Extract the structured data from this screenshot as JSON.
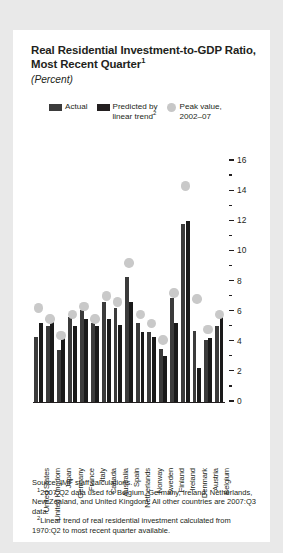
{
  "card": {
    "title_line1": "Real Residential Investment-to-GDP Ratio,",
    "title_line2": "Most Recent Quarter",
    "title_footnote_marker": "1",
    "subtitle": "(Percent)"
  },
  "legend": {
    "items": [
      {
        "label": "Actual",
        "marker": "square",
        "color": "#3b3b3b"
      },
      {
        "label": "Predicted by\nlinear trend",
        "footnote_marker": "2",
        "marker": "square",
        "color": "#231f20"
      },
      {
        "label": "Peak value,\n2002–07",
        "marker": "circle",
        "color": "#c7c7c7"
      }
    ]
  },
  "footnotes": {
    "source": "Source: IMF staff calculations.",
    "note1_marker": "1",
    "note1": "2007:Q2 data used for Belgium, Germany, Ireland, Netherlands, New Zealand, and United Kingdom. All other countries are 2007:Q3 data.",
    "note2_marker": "2",
    "note2": "Linear trend of real residential investment calculated from 1970:Q2 to most recent quarter available."
  },
  "chart_data": {
    "type": "bar",
    "title": "Real Residential Investment-to-GDP Ratio, Most Recent Quarter",
    "subtitle": "(Percent)",
    "xlabel": "",
    "ylabel": "Percent",
    "ylim": [
      0,
      16
    ],
    "ytick_major": [
      0,
      2,
      4,
      6,
      8,
      10,
      12,
      14,
      16
    ],
    "ytick_minor": [
      1,
      3,
      5,
      7,
      9,
      11,
      13,
      15
    ],
    "grid": false,
    "legend_position": "top",
    "categories": [
      "United States",
      "United Kingdom",
      "Japan",
      "Germany",
      "France",
      "Italy",
      "Canada",
      "Australia",
      "Spain",
      "Netherlands",
      "Norway",
      "Sweden",
      "Finland",
      "Ireland",
      "Denmark",
      "Austria",
      "Belgium"
    ],
    "series": [
      {
        "name": "Actual",
        "color": "#3b3b3b",
        "values": [
          4.3,
          5.0,
          3.4,
          5.6,
          6.1,
          5.2,
          6.6,
          6.2,
          8.3,
          5.2,
          4.6,
          3.5,
          6.9,
          11.8,
          4.7,
          4.1,
          5.0
        ]
      },
      {
        "name": "Predicted by linear trend",
        "color": "#1a1a1a",
        "values": [
          5.2,
          5.3,
          4.2,
          5.0,
          5.5,
          5.0,
          5.5,
          5.1,
          6.6,
          4.6,
          4.3,
          3.0,
          5.2,
          12.0,
          2.2,
          4.2,
          5.6
        ]
      }
    ],
    "peak_values": {
      "name": "Peak value, 2002–07",
      "color": "#c9c9c9",
      "values": [
        6.2,
        5.5,
        4.4,
        5.8,
        6.3,
        5.5,
        7.0,
        6.6,
        9.2,
        5.8,
        5.2,
        4.1,
        7.2,
        14.3,
        6.8,
        4.8,
        5.8
      ]
    }
  }
}
